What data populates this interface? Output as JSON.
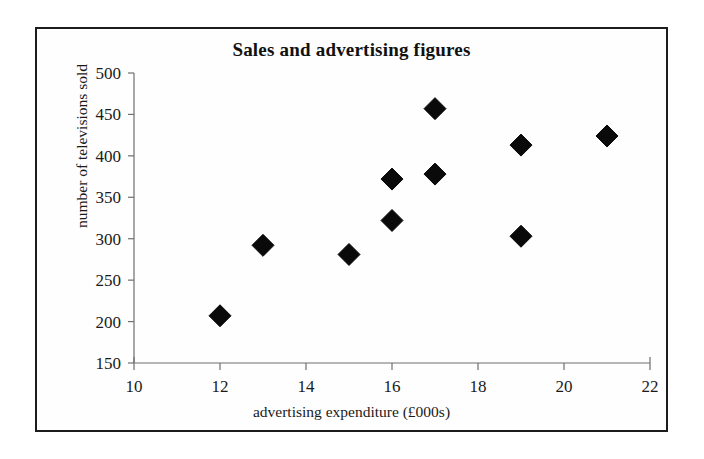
{
  "figure": {
    "title": "Sales and advertising figures",
    "x_axis_title": "advertising expenditure (£000s)",
    "y_axis_title": "number of televisions sold",
    "frame_color": "#1c1c1c",
    "marker_color": "#0a0a0a",
    "axis_color": "#6e6e6e"
  },
  "chart_data": {
    "type": "scatter",
    "title": "Sales and advertising figures",
    "subtitle": "",
    "xlabel": "advertising expenditure (£000s)",
    "ylabel": "number of televisions sold",
    "xlim": [
      10,
      22
    ],
    "ylim": [
      150,
      500
    ],
    "xticks": [
      10,
      12,
      14,
      16,
      18,
      20,
      22
    ],
    "yticks": [
      150,
      200,
      250,
      300,
      350,
      400,
      450,
      500
    ],
    "xtick_labels": [
      "10",
      "12",
      "14",
      "16",
      "18",
      "20",
      "22"
    ],
    "ytick_labels": [
      "150",
      "200",
      "250",
      "300",
      "350",
      "400",
      "450",
      "500"
    ],
    "grid": false,
    "legend": null,
    "marker": "diamond",
    "series": [
      {
        "name": "sales vs advertising",
        "points": [
          {
            "x": 12,
            "y": 207
          },
          {
            "x": 13,
            "y": 292
          },
          {
            "x": 15,
            "y": 281
          },
          {
            "x": 16,
            "y": 372
          },
          {
            "x": 16,
            "y": 322
          },
          {
            "x": 17,
            "y": 457
          },
          {
            "x": 17,
            "y": 378
          },
          {
            "x": 19,
            "y": 413
          },
          {
            "x": 19,
            "y": 303
          },
          {
            "x": 21,
            "y": 424
          }
        ]
      }
    ]
  }
}
